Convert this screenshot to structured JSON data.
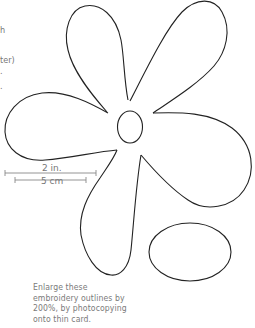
{
  "left_fragments": [
    {
      "text": "h",
      "top": 25
    },
    {
      "text": "ter)",
      "top": 55
    },
    {
      "text": ".",
      "top": 66
    },
    {
      "text": ".",
      "top": 81
    }
  ],
  "scale": {
    "inch_label": "2 in.",
    "cm_label": "5 cm"
  },
  "caption": {
    "lines": [
      "Enlarge these",
      "embroidery outlines by",
      "200%, by photocopying",
      "onto thin card."
    ]
  },
  "colors": {
    "outline": "#222222",
    "scale_line": "#888888",
    "text": "#777777"
  }
}
